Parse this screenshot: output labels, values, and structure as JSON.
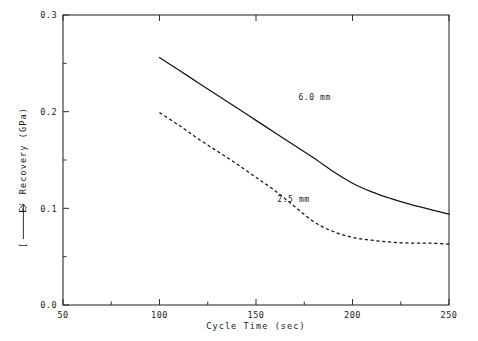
{
  "chart_data": {
    "type": "line",
    "title": "",
    "xlabel": "Cycle Time (sec)",
    "ylabel": "[⟶ E' Recovery (GPa)",
    "ylabel_bracket": "[",
    "ylabel_text": "E' Recovery (GPa)",
    "xlim": [
      50,
      250
    ],
    "ylim": [
      0.0,
      0.3
    ],
    "grid": false,
    "legend": "inline-annotations",
    "xticks": [
      50,
      100,
      150,
      200,
      250
    ],
    "xtick_labels": [
      "50",
      "100",
      "150",
      "200",
      "250"
    ],
    "xticks_minor": [
      75,
      125,
      175,
      225
    ],
    "yticks": [
      0.0,
      0.1,
      0.2,
      0.3
    ],
    "ytick_labels": [
      "0.0",
      "0.1",
      "0.2",
      "0.3"
    ],
    "yticks_minor": [
      0.05,
      0.15,
      0.25
    ],
    "series": [
      {
        "name": "6.0 mm",
        "style": "solid",
        "label": "6.0 mm",
        "label_x": 172,
        "label_y": 0.212,
        "x": [
          100,
          110,
          120,
          130,
          140,
          150,
          160,
          170,
          180,
          190,
          200,
          210,
          220,
          230,
          240,
          250
        ],
        "y": [
          0.256,
          0.243,
          0.23,
          0.217,
          0.204,
          0.191,
          0.178,
          0.165,
          0.152,
          0.138,
          0.126,
          0.117,
          0.11,
          0.104,
          0.099,
          0.094
        ]
      },
      {
        "name": "2.5 mm",
        "style": "dashed",
        "label": "2.5 mm",
        "label_x": 161,
        "label_y": 0.107,
        "x": [
          100,
          110,
          120,
          130,
          140,
          150,
          160,
          170,
          180,
          190,
          200,
          210,
          220,
          230,
          240,
          250
        ],
        "y": [
          0.199,
          0.186,
          0.172,
          0.159,
          0.146,
          0.132,
          0.118,
          0.102,
          0.086,
          0.076,
          0.07,
          0.067,
          0.065,
          0.064,
          0.064,
          0.063
        ]
      }
    ]
  },
  "colors": {
    "background": "#ffffff",
    "axis": "#303030",
    "curve": "#151515",
    "text": "#1a1a1a"
  }
}
